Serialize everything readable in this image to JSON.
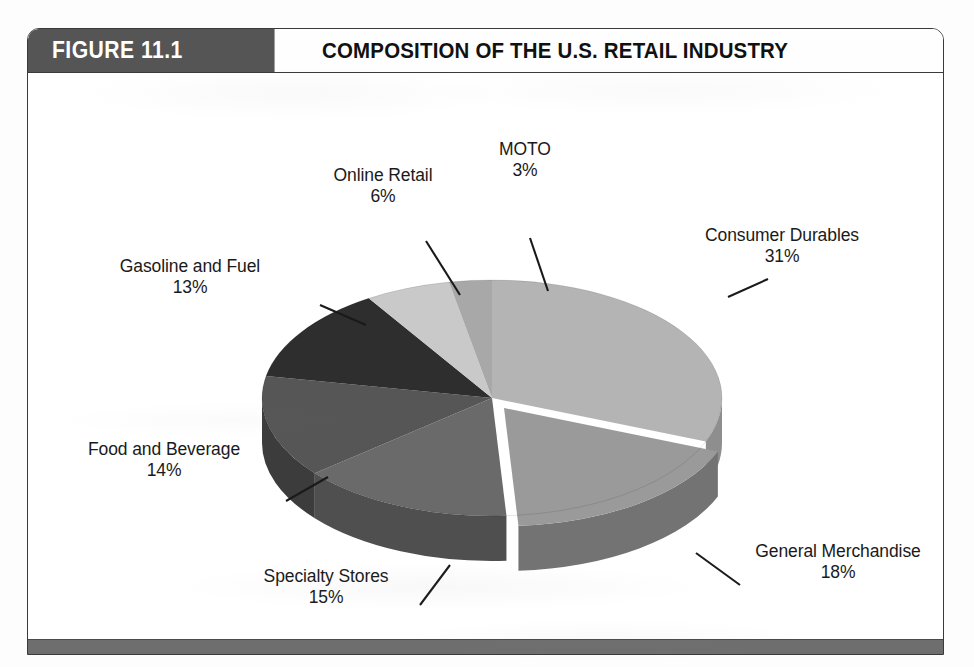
{
  "figure": {
    "badge": "FIGURE 11.1",
    "title": "COMPOSITION OF THE U.S. RETAIL INDUSTRY"
  },
  "chart_data": {
    "type": "pie",
    "title": "COMPOSITION OF THE U.S. RETAIL INDUSTRY",
    "style": "3d-pie-exploded",
    "legend": "none",
    "labels_position": "outside-with-leader-lines",
    "total": 100,
    "unit": "%",
    "categories": [
      "Consumer Durables",
      "General Merchandise",
      "Specialty Stores",
      "Food and Beverage",
      "Gasoline and Fuel",
      "Online Retail",
      "MOTO"
    ],
    "values": [
      31,
      18,
      15,
      14,
      13,
      6,
      3
    ],
    "slices": [
      {
        "label": "Consumer Durables",
        "value": 31,
        "percent": "31%",
        "color": "#b4b4b4",
        "side_color": "#8e8e8e",
        "exploded": false
      },
      {
        "label": "General Merchandise",
        "value": 18,
        "percent": "18%",
        "color": "#9a9a9a",
        "side_color": "#737373",
        "exploded": true
      },
      {
        "label": "Specialty Stores",
        "value": 15,
        "percent": "15%",
        "color": "#6a6a6a",
        "side_color": "#4f4f4f",
        "exploded": false
      },
      {
        "label": "Food and Beverage",
        "value": 14,
        "percent": "14%",
        "color": "#565656",
        "side_color": "#3c3c3c",
        "exploded": false
      },
      {
        "label": "Gasoline and Fuel",
        "value": 13,
        "percent": "13%",
        "color": "#2e2e2e",
        "side_color": "#1d1d1d",
        "exploded": false
      },
      {
        "label": "Online Retail",
        "value": 6,
        "percent": "6%",
        "color": "#c9c9c9",
        "side_color": "#a0a0a0",
        "exploded": false
      },
      {
        "label": "MOTO",
        "value": 3,
        "percent": "3%",
        "color": "#a8a8a8",
        "side_color": "#858585",
        "exploded": false
      }
    ]
  },
  "labels": {
    "moto": {
      "name": "MOTO",
      "pct": "3%"
    },
    "online": {
      "name": "Online Retail",
      "pct": "6%"
    },
    "gasoline": {
      "name": "Gasoline and Fuel",
      "pct": "13%"
    },
    "food": {
      "name": "Food and Beverage",
      "pct": "14%"
    },
    "specialty": {
      "name": "Specialty Stores",
      "pct": "15%"
    },
    "general": {
      "name": "General Merchandise",
      "pct": "18%"
    },
    "consumer": {
      "name": "Consumer Durables",
      "pct": "31%"
    }
  },
  "colors": {
    "badge_bg": "#555555",
    "border": "#3a3a3a",
    "footer_rule": "#6e6e6e",
    "page_bg": "#fdfdfd",
    "text": "#1a1a1a"
  }
}
